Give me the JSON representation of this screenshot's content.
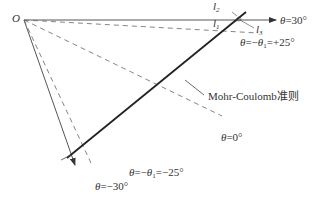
{
  "diagram": {
    "origin_label": "O",
    "axes": [
      {
        "id": "theta-30",
        "label": "θ=30°"
      },
      {
        "id": "theta-neg30",
        "label": "θ=−30°"
      }
    ],
    "dashed_lines": [
      {
        "id": "theta-pos25",
        "label": "θ=−θ₁=+25°"
      },
      {
        "id": "theta-0",
        "label": "θ=0°"
      },
      {
        "id": "theta-neg25",
        "label": "θ=−θ₁=−25°"
      }
    ],
    "criterion_label": "Mohr-Coulomb准则",
    "small_labels": {
      "l1": "l",
      "l1_sub": "1",
      "l2": "l",
      "l2_sub": "2",
      "l3": "l",
      "l3_sub": "3"
    },
    "text": {
      "theta30": "θ=30°",
      "thetaPos25_a": "θ=−θ",
      "thetaPos25_sub": "1",
      "thetaPos25_b": "=+25°",
      "theta0": "θ=0°",
      "thetaNeg25_a": "θ=−θ",
      "thetaNeg25_sub": "1",
      "thetaNeg25_b": "=−25°",
      "thetaNeg30": "θ=−30°"
    },
    "colors": {
      "line": "#333333",
      "dashed": "#555555",
      "criterion": "#222222"
    }
  }
}
